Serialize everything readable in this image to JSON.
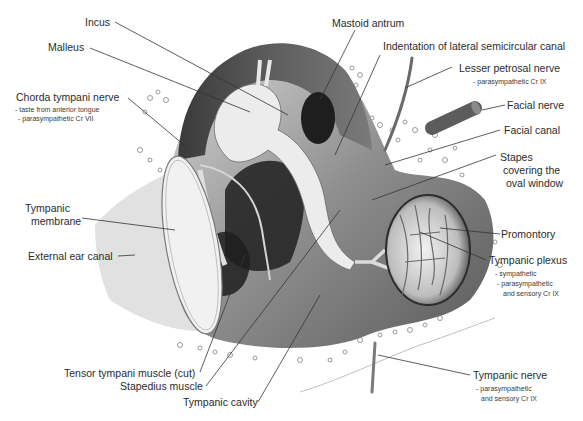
{
  "diagram": {
    "colors": {
      "background": "#ffffff",
      "ink": "#2b2b2b",
      "shade_dark": "#2e2e2e",
      "shade_mid": "#8a8a8a",
      "shade_light": "#d6d6d6"
    }
  },
  "labels": {
    "incus": {
      "text": "Incus"
    },
    "malleus": {
      "text": "Malleus"
    },
    "chorda": {
      "text": "Chorda tympani nerve",
      "notes": [
        "- taste from anterior tongue",
        "- parasympathetic Cr VII"
      ]
    },
    "tympanic_membrane": {
      "line1": "Tympanic",
      "line2": "membrane"
    },
    "external_ear_canal": {
      "text": "External ear canal"
    },
    "tensor_tympani": {
      "text": "Tensor tympani muscle (cut)"
    },
    "stapedius": {
      "text": "Stapedius muscle"
    },
    "tympanic_cavity": {
      "text": "Tympanic cavity"
    },
    "mastoid_antrum": {
      "text": "Mastoid antrum"
    },
    "lateral_canal": {
      "text": "Indentation of lateral semicircular canal"
    },
    "lesser_petrosal": {
      "text": "Lesser petrosal nerve",
      "notes": [
        "- parasympathetic Cr IX"
      ]
    },
    "facial_nerve": {
      "text": "Facial nerve"
    },
    "facial_canal": {
      "text": "Facial canal"
    },
    "stapes": {
      "line1": "Stapes",
      "line2": "covering the",
      "line3": "oval window"
    },
    "promontory": {
      "text": "Promontory"
    },
    "tympanic_plexus": {
      "text": "Tympanic plexus",
      "notes": [
        "- sympathetic",
        "- parasympathetic",
        "and sensory Cr IX"
      ]
    },
    "tympanic_nerve": {
      "text": "Tympanic nerve",
      "notes": [
        "- parasympathetic",
        "and sensory Cr IX"
      ]
    }
  }
}
